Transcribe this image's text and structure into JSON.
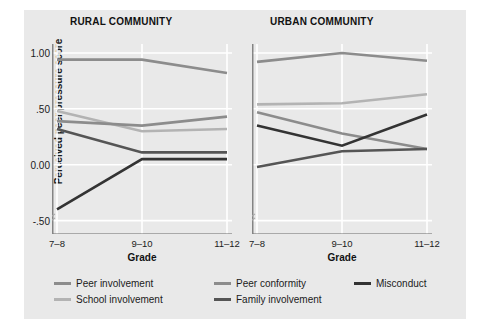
{
  "chart_data": {
    "type": "line",
    "title": "",
    "panels": [
      {
        "title": "RURAL COMMUNITY",
        "xlabel": "Grade",
        "ylabel": "Perceived peer pressure score",
        "categories": [
          "7–8",
          "9–10",
          "11–12"
        ],
        "series": [
          {
            "name": "Peer involvement",
            "values": [
              0.94,
              0.94,
              0.82
            ],
            "color": "#8c8c8c"
          },
          {
            "name": "School involvement",
            "values": [
              0.48,
              0.3,
              0.32
            ],
            "color": "#b3b3b3"
          },
          {
            "name": "Peer conformity",
            "values": [
              0.39,
              0.35,
              0.43
            ],
            "color": "#8c8c8c"
          },
          {
            "name": "Family involvement",
            "values": [
              0.32,
              0.11,
              0.11
            ],
            "color": "#555555"
          },
          {
            "name": "Misconduct",
            "values": [
              -0.4,
              0.05,
              0.05
            ],
            "color": "#333333"
          }
        ]
      },
      {
        "title": "URBAN COMMUNITY",
        "xlabel": "Grade",
        "categories": [
          "7–8",
          "9–10",
          "11–12"
        ],
        "series": [
          {
            "name": "Peer involvement",
            "values": [
              0.92,
              1.0,
              0.93
            ],
            "color": "#8c8c8c"
          },
          {
            "name": "School involvement",
            "values": [
              0.54,
              0.55,
              0.63
            ],
            "color": "#b3b3b3"
          },
          {
            "name": "Peer conformity",
            "values": [
              0.47,
              0.28,
              0.14
            ],
            "color": "#8c8c8c"
          },
          {
            "name": "Family involvement",
            "values": [
              -0.02,
              0.12,
              0.14
            ],
            "color": "#555555"
          },
          {
            "name": "Misconduct",
            "values": [
              0.35,
              0.17,
              0.45
            ],
            "color": "#333333"
          }
        ]
      }
    ],
    "yticks": [
      1.0,
      0.5,
      0.0,
      -0.5
    ],
    "ytick_labels": [
      "1.00",
      ".50",
      "0.00",
      "-.50"
    ],
    "ylim": [
      -0.62,
      1.08
    ],
    "grid": true,
    "legend_position": "bottom",
    "legend": [
      {
        "label": "Peer involvement",
        "color": "#8c8c8c"
      },
      {
        "label": "School involvement",
        "color": "#b3b3b3"
      },
      {
        "label": "Peer conformity",
        "color": "#8c8c8c"
      },
      {
        "label": "Family involvement",
        "color": "#555555"
      },
      {
        "label": "Misconduct",
        "color": "#333333"
      }
    ],
    "background": "#e9e9e9"
  }
}
